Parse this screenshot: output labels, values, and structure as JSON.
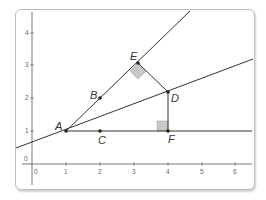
{
  "diagram": {
    "type": "coordinate-geometry",
    "x_ticks": [
      "0",
      "1",
      "2",
      "3",
      "4",
      "5",
      "6"
    ],
    "y_ticks": [
      "0",
      "1",
      "2",
      "3",
      "4"
    ],
    "points": {
      "A": {
        "label": "A",
        "x": 1,
        "y": 1
      },
      "B": {
        "label": "B",
        "x": 2,
        "y": 2
      },
      "C": {
        "label": "C",
        "x": 2,
        "y": 1
      },
      "D": {
        "label": "D",
        "x": 4,
        "y": 2.2
      },
      "E": {
        "label": "E",
        "x": 3.1,
        "y": 3.1
      },
      "F": {
        "label": "F",
        "x": 4,
        "y": 1
      }
    },
    "segments": [
      "AE ray",
      "AD ray",
      "AF ray",
      "ED",
      "DF"
    ],
    "right_angles": [
      "E",
      "F"
    ],
    "colors": {
      "line": "#333333",
      "axis": "#555555",
      "right_angle_fill": "#c8c8c8",
      "panel_border": "#bdbdbd"
    }
  }
}
